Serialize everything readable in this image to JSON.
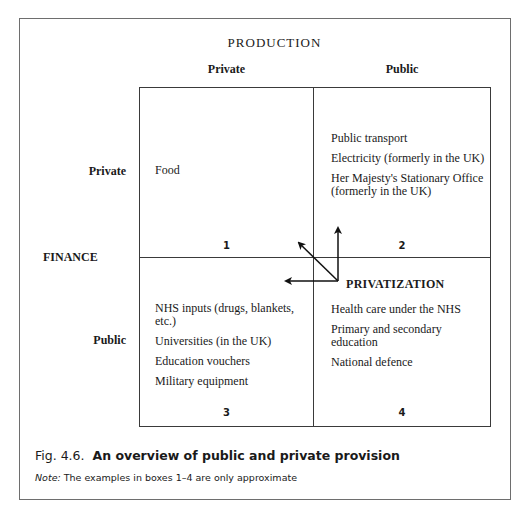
{
  "diagram": {
    "top_axis_title": "PRODUCTION",
    "top_axis_columns": [
      "Private",
      "Public"
    ],
    "left_axis_title": "FINANCE",
    "left_axis_rows": [
      "Private",
      "Public"
    ],
    "boxes": [
      {
        "number": "1",
        "items": [
          "Food"
        ]
      },
      {
        "number": "2",
        "items": [
          "Public transport",
          "Electricity (formerly in the UK)",
          "Her Majesty's Stationary Office (formerly in the UK)"
        ]
      },
      {
        "number": "3",
        "items": [
          "NHS inputs (drugs, blankets, etc.)",
          "Universities (in the UK)",
          "Education vouchers",
          "Military equipment"
        ]
      },
      {
        "number": "4",
        "items": [
          "Health care under the NHS",
          "Primary and secondary education",
          "National defence"
        ]
      }
    ],
    "arrow_label": "PRIVATIZATION"
  },
  "caption": {
    "fig_number": "Fig. 4.6.",
    "title": "An overview of public and private provision",
    "note_label": "Note:",
    "note_text": "The examples in boxes 1–4 are only approximate"
  }
}
